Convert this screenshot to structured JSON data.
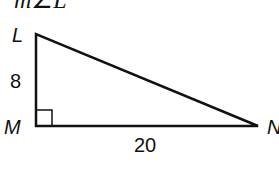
{
  "header": {
    "prompt": "m∠L"
  },
  "diagram": {
    "type": "right-triangle",
    "vertices": {
      "L": "L",
      "M": "M",
      "N": "N"
    },
    "sides": {
      "LM": "8",
      "MN": "20"
    },
    "right_angle_at": "M",
    "stroke_color": "#111111"
  }
}
